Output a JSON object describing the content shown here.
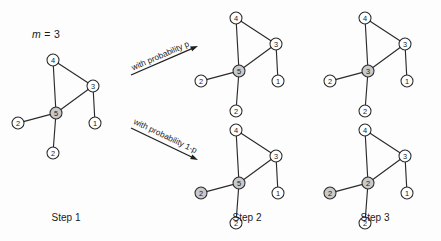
{
  "figure": {
    "background_color": "#fdfdfd",
    "ink_color": "#2b2b2b",
    "shaded_node_color": "#c9c9c9",
    "plain_node_color": "#ffffff",
    "parameter_label": "m = 3",
    "parameter_symbol": "m",
    "parameter_value": "= 3",
    "width": 441,
    "height": 241
  },
  "arrows": [
    {
      "name": "upper-branch",
      "label": "with probability p",
      "from": "Step 1",
      "to": "Step 2 (upper)"
    },
    {
      "name": "lower-branch",
      "label": "with probability 1-p",
      "from": "Step 1",
      "to": "Step 2 (lower)"
    }
  ],
  "step_labels": [
    {
      "text": "Step 1",
      "x": 66,
      "y": 220
    },
    {
      "text": "Step 2",
      "x": 247,
      "y": 220
    },
    {
      "text": "Step 3",
      "x": 375,
      "y": 220
    }
  ],
  "graphs": [
    {
      "name": "step1-graph",
      "step": "Step 1",
      "branch": "initial",
      "origin": {
        "x": 13,
        "y": 48
      },
      "nodes": [
        {
          "id": "n4",
          "label": "4",
          "x": 40,
          "y": 12,
          "shaded": false
        },
        {
          "id": "n3",
          "label": "3",
          "x": 80,
          "y": 38,
          "shaded": false
        },
        {
          "id": "nc",
          "label": "5",
          "x": 43,
          "y": 65,
          "shaded": true
        },
        {
          "id": "nl2",
          "label": "2",
          "x": 5,
          "y": 75,
          "shaded": false
        },
        {
          "id": "nb2",
          "label": "2",
          "x": 40,
          "y": 105,
          "shaded": false
        },
        {
          "id": "n1",
          "label": "1",
          "x": 82,
          "y": 75,
          "shaded": false
        }
      ],
      "edges": [
        [
          "n4",
          "n3"
        ],
        [
          "n4",
          "nc"
        ],
        [
          "n3",
          "nc"
        ],
        [
          "nc",
          "nl2"
        ],
        [
          "nc",
          "nb2"
        ],
        [
          "n3",
          "n1"
        ]
      ]
    },
    {
      "name": "step2-upper-graph",
      "step": "Step 2",
      "branch": "with probability p",
      "origin": {
        "x": 196,
        "y": 6
      },
      "nodes": [
        {
          "id": "n4",
          "label": "4",
          "x": 40,
          "y": 12,
          "shaded": false
        },
        {
          "id": "n3",
          "label": "3",
          "x": 80,
          "y": 38,
          "shaded": false
        },
        {
          "id": "nc",
          "label": "5",
          "x": 43,
          "y": 65,
          "shaded": true
        },
        {
          "id": "nl2",
          "label": "2",
          "x": 5,
          "y": 75,
          "shaded": false
        },
        {
          "id": "nb2",
          "label": "2",
          "x": 40,
          "y": 105,
          "shaded": false
        },
        {
          "id": "n1",
          "label": "1",
          "x": 82,
          "y": 75,
          "shaded": false
        }
      ],
      "edges": [
        [
          "n4",
          "n3"
        ],
        [
          "n4",
          "nc"
        ],
        [
          "n3",
          "nc"
        ],
        [
          "nc",
          "nl2"
        ],
        [
          "nc",
          "nb2"
        ],
        [
          "n3",
          "n1"
        ]
      ]
    },
    {
      "name": "step2-lower-graph",
      "step": "Step 2",
      "branch": "with probability 1-p",
      "origin": {
        "x": 196,
        "y": 118
      },
      "nodes": [
        {
          "id": "n4",
          "label": "4",
          "x": 40,
          "y": 12,
          "shaded": false
        },
        {
          "id": "n3",
          "label": "3",
          "x": 80,
          "y": 38,
          "shaded": false
        },
        {
          "id": "nc",
          "label": "5",
          "x": 43,
          "y": 65,
          "shaded": true
        },
        {
          "id": "nl2",
          "label": "2",
          "x": 5,
          "y": 75,
          "shaded": true
        },
        {
          "id": "nb2",
          "label": "2",
          "x": 40,
          "y": 105,
          "shaded": false
        },
        {
          "id": "n1",
          "label": "1",
          "x": 82,
          "y": 75,
          "shaded": false
        }
      ],
      "edges": [
        [
          "n4",
          "n3"
        ],
        [
          "n4",
          "nc"
        ],
        [
          "n3",
          "nc"
        ],
        [
          "nc",
          "nl2"
        ],
        [
          "nc",
          "nb2"
        ],
        [
          "n3",
          "n1"
        ]
      ]
    },
    {
      "name": "step3-upper-graph",
      "step": "Step 3",
      "branch": "with probability p",
      "origin": {
        "x": 325,
        "y": 6
      },
      "nodes": [
        {
          "id": "n4",
          "label": "4",
          "x": 40,
          "y": 12,
          "shaded": false
        },
        {
          "id": "n3",
          "label": "3",
          "x": 80,
          "y": 38,
          "shaded": false
        },
        {
          "id": "nc",
          "label": "3",
          "x": 43,
          "y": 65,
          "shaded": true
        },
        {
          "id": "nl2",
          "label": "2",
          "x": 5,
          "y": 75,
          "shaded": false
        },
        {
          "id": "nb2",
          "label": "2",
          "x": 40,
          "y": 105,
          "shaded": false
        },
        {
          "id": "n1",
          "label": "1",
          "x": 82,
          "y": 75,
          "shaded": false
        }
      ],
      "edges": [
        [
          "n4",
          "n3"
        ],
        [
          "n4",
          "nc"
        ],
        [
          "n3",
          "nc"
        ],
        [
          "nc",
          "nl2"
        ],
        [
          "nc",
          "nb2"
        ],
        [
          "n3",
          "n1"
        ]
      ]
    },
    {
      "name": "step3-lower-graph",
      "step": "Step 3",
      "branch": "with probability 1-p",
      "origin": {
        "x": 325,
        "y": 118
      },
      "nodes": [
        {
          "id": "n4",
          "label": "4",
          "x": 40,
          "y": 12,
          "shaded": false
        },
        {
          "id": "n3",
          "label": "3",
          "x": 80,
          "y": 38,
          "shaded": false
        },
        {
          "id": "nc",
          "label": "2",
          "x": 43,
          "y": 65,
          "shaded": true
        },
        {
          "id": "nl2",
          "label": "2",
          "x": 5,
          "y": 75,
          "shaded": true
        },
        {
          "id": "nb2",
          "label": "2",
          "x": 40,
          "y": 105,
          "shaded": false
        },
        {
          "id": "n1",
          "label": "1",
          "x": 82,
          "y": 75,
          "shaded": false
        }
      ],
      "edges": [
        [
          "n4",
          "n3"
        ],
        [
          "n4",
          "nc"
        ],
        [
          "n3",
          "nc"
        ],
        [
          "nc",
          "nl2"
        ],
        [
          "nc",
          "nb2"
        ],
        [
          "n3",
          "n1"
        ]
      ]
    }
  ]
}
